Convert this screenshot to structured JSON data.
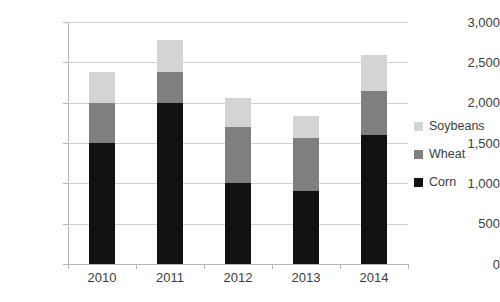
{
  "chart_data": {
    "type": "bar",
    "subtype": "stacked-bar",
    "title": "",
    "subtitle": "",
    "xlabel": "",
    "ylabel": "",
    "categories": [
      "2010",
      "2011",
      "2012",
      "2013",
      "2014"
    ],
    "series": [
      {
        "name": "Corn",
        "color": "#111111",
        "values": [
          1500,
          2000,
          1010,
          900,
          1600
        ]
      },
      {
        "name": "Wheat",
        "color": "#7f7f7f",
        "values": [
          500,
          380,
          690,
          660,
          550
        ]
      },
      {
        "name": "Soybeans",
        "color": "#d4d4d4",
        "values": [
          380,
          400,
          360,
          280,
          440
        ]
      }
    ],
    "stack_totals": [
      2380,
      2780,
      2060,
      1840,
      2590
    ],
    "ylim": [
      0,
      3000
    ],
    "ytick_values": [
      0,
      500,
      1000,
      1500,
      2000,
      2500,
      3000
    ],
    "ytick_labels": [
      "0",
      "500",
      "1,000",
      "1,500",
      "2,000",
      "2,500",
      "3,000"
    ],
    "grid": true,
    "legend_position": "right",
    "legend_entries": [
      "Soybeans",
      "Wheat",
      "Corn"
    ],
    "colors": {
      "soybeans": "#d4d4d4",
      "wheat": "#7f7f7f",
      "corn": "#111111",
      "gridline": "#d0d0d0",
      "axis": "#b5b5b5",
      "text": "#3c3c3c",
      "background": "#ffffff"
    }
  }
}
